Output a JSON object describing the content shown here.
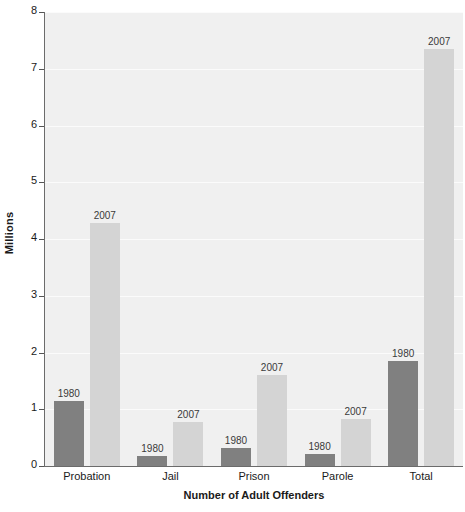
{
  "chart_data": {
    "type": "bar",
    "title": "",
    "subtitle": "",
    "xlabel": "Number of Adult Offenders",
    "ylabel": "Millions",
    "ylim": [
      0,
      8
    ],
    "ytick_labels": [
      "0",
      "1",
      "2",
      "3",
      "4",
      "5",
      "6",
      "7",
      "8"
    ],
    "yticks": [
      0,
      1,
      2,
      3,
      4,
      5,
      6,
      7,
      8
    ],
    "grid": true,
    "grid_axis": "y",
    "legend": "none",
    "legend_position": "none",
    "bar_labels_shown": true,
    "categories": [
      "Probation",
      "Jail",
      "Prison",
      "Parole",
      "Total"
    ],
    "series": [
      {
        "name": "1980",
        "color": "#808080",
        "values": [
          1.15,
          0.18,
          0.32,
          0.22,
          1.85
        ]
      },
      {
        "name": "2007",
        "color": "#d4d4d4",
        "values": [
          4.29,
          0.78,
          1.6,
          0.83,
          7.35
        ]
      }
    ],
    "annotations": [
      {
        "category": "Probation",
        "series": "1980",
        "text": "1980"
      },
      {
        "category": "Probation",
        "series": "2007",
        "text": "2007"
      },
      {
        "category": "Jail",
        "series": "1980",
        "text": "1980"
      },
      {
        "category": "Jail",
        "series": "2007",
        "text": "2007"
      },
      {
        "category": "Prison",
        "series": "1980",
        "text": "1980"
      },
      {
        "category": "Prison",
        "series": "2007",
        "text": "2007"
      },
      {
        "category": "Parole",
        "series": "1980",
        "text": "1980"
      },
      {
        "category": "Parole",
        "series": "2007",
        "text": "2007"
      },
      {
        "category": "Total",
        "series": "1980",
        "text": "1980"
      },
      {
        "category": "Total",
        "series": "2007",
        "text": "2007"
      }
    ],
    "colors": {
      "plot_background": "#f0f0f0",
      "page_background": "#ffffff",
      "gridline": "#fbfbfb",
      "axis_line": "#6b6b6b",
      "text": "#1a1a1a",
      "bar_label_text": "#3a3a3a"
    }
  }
}
